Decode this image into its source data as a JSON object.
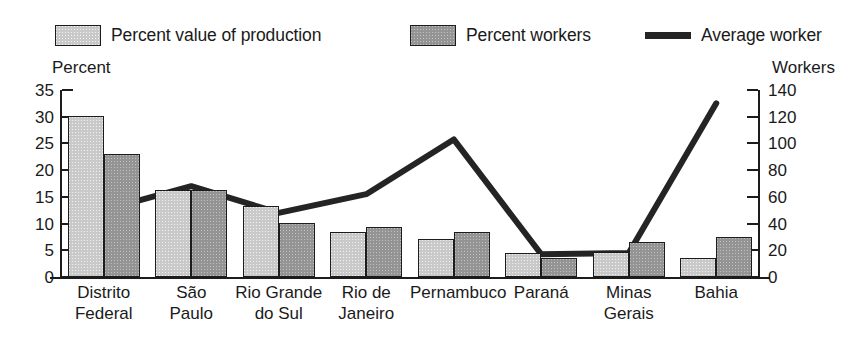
{
  "legend": {
    "items": [
      {
        "label": "Percent value of production",
        "marker": "light-swatch"
      },
      {
        "label": "Percent workers",
        "marker": "dark-swatch"
      },
      {
        "label": "Average worker",
        "marker": "line-swatch"
      }
    ]
  },
  "axes": {
    "left_title": "Percent",
    "right_title": "Workers",
    "left_ticks": [
      "35",
      "30",
      "25",
      "20",
      "15",
      "10",
      "5",
      "0"
    ],
    "right_ticks": [
      "140",
      "120",
      "100",
      "80",
      "60",
      "40",
      "20",
      "0"
    ]
  },
  "colors": {
    "light_bar": "#c9c9c9",
    "dark_bar": "#949494",
    "line": "#242424",
    "axis": "#1c1c1c",
    "background": "#ffffff"
  },
  "chart_data": {
    "type": "bar",
    "title": "",
    "subtitle": "",
    "xlabel": "",
    "ylabel": "Percent",
    "y2label": "Workers",
    "ylim": [
      0,
      35
    ],
    "y2lim": [
      0,
      140
    ],
    "grid": false,
    "legend_position": "top",
    "categories": [
      "Distrito\nFederal",
      "São\nPaulo",
      "Rio Grande\ndo Sul",
      "Rio de\nJaneiro",
      "Pernambuco",
      "Paraná",
      "Minas\nGerais",
      "Bahia"
    ],
    "series": [
      {
        "name": "Percent value of production",
        "type": "bar",
        "axis": "left",
        "values": [
          30.2,
          16.3,
          13.2,
          8.5,
          7.2,
          4.5,
          4.7,
          3.5
        ]
      },
      {
        "name": "Percent workers",
        "type": "bar",
        "axis": "left",
        "values": [
          23.1,
          16.2,
          10.2,
          9.3,
          8.5,
          3.5,
          6.5,
          7.5
        ]
      },
      {
        "name": "Average worker",
        "type": "line",
        "axis": "right",
        "values": [
          50,
          68,
          48,
          62,
          103,
          17,
          18,
          130
        ]
      }
    ]
  }
}
